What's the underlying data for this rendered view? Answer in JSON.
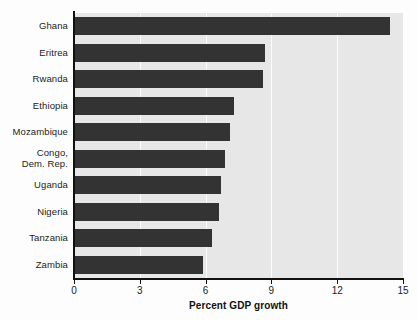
{
  "chart_data": {
    "type": "bar",
    "orientation": "horizontal",
    "title": "",
    "xlabel": "Percent GDP growth",
    "ylabel": "",
    "xlim": [
      0,
      15
    ],
    "xticks": [
      0,
      3,
      6,
      9,
      12,
      15
    ],
    "xtick_labels": [
      "0",
      "3",
      "6",
      "9",
      "12",
      "15"
    ],
    "grid": "vertical-white",
    "legend": "none",
    "bar_color": "#333333",
    "plot_background": "#e7e7e7",
    "categories": [
      "Ghana",
      "Eritrea",
      "Rwanda",
      "Ethiopia",
      "Mozambique",
      "Congo,\nDem. Rep.",
      "Uganda",
      "Nigeria",
      "Tanzania",
      "Zambia"
    ],
    "values": [
      14.4,
      8.7,
      8.6,
      7.3,
      7.1,
      6.9,
      6.7,
      6.6,
      6.3,
      5.9
    ]
  }
}
